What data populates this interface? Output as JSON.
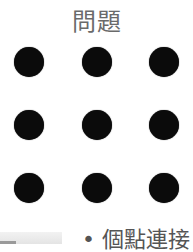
{
  "title": "問題",
  "grid": {
    "rows": 3,
    "cols": 3,
    "dot_color": "#0b0b0b",
    "dots": [
      {
        "x": 29,
        "y": 62
      },
      {
        "x": 97,
        "y": 62
      },
      {
        "x": 164,
        "y": 62
      },
      {
        "x": 29,
        "y": 125
      },
      {
        "x": 97,
        "y": 125
      },
      {
        "x": 164,
        "y": 125
      },
      {
        "x": 29,
        "y": 188
      },
      {
        "x": 97,
        "y": 188
      },
      {
        "x": 164,
        "y": 188
      }
    ]
  },
  "footer": {
    "text": "• 個點連接"
  }
}
